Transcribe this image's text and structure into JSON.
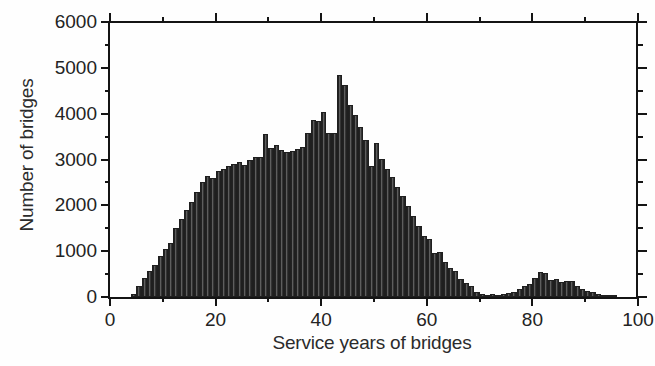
{
  "chart_data": {
    "type": "bar",
    "title": "",
    "subtitle": "",
    "xlabel": "Service years of bridges",
    "ylabel": "Number of bridges",
    "xlim": [
      0,
      100
    ],
    "ylim": [
      0,
      6000
    ],
    "grid": false,
    "legend": null,
    "bin_width": 1,
    "x_ticks": [
      0,
      20,
      40,
      60,
      80,
      100
    ],
    "x_tick_labels": [
      "0",
      "20",
      "40",
      "60",
      "80",
      "100"
    ],
    "x_minor_ticks": [
      10,
      30,
      50,
      70,
      90
    ],
    "y_ticks": [
      0,
      1000,
      2000,
      3000,
      4000,
      5000,
      6000
    ],
    "y_tick_labels": [
      "0",
      "1000",
      "2000",
      "3000",
      "4000",
      "5000",
      "6000"
    ],
    "y_minor_ticks": [
      500,
      1500,
      2500,
      3500,
      4500,
      5500
    ],
    "bar_color": "#4c4c4c",
    "bar_edge_color": "#1f1f1f",
    "axis_color": "#141414",
    "background_color": "#ffffff",
    "x": [
      4,
      5,
      6,
      7,
      8,
      9,
      10,
      11,
      12,
      13,
      14,
      15,
      16,
      17,
      18,
      19,
      20,
      21,
      22,
      23,
      24,
      25,
      26,
      27,
      28,
      29,
      30,
      31,
      32,
      33,
      34,
      35,
      36,
      37,
      38,
      39,
      40,
      41,
      42,
      43,
      44,
      45,
      46,
      47,
      48,
      49,
      50,
      51,
      52,
      53,
      54,
      55,
      56,
      57,
      58,
      59,
      60,
      61,
      62,
      63,
      64,
      65,
      66,
      67,
      68,
      69,
      70,
      71,
      72,
      73,
      74,
      75,
      76,
      77,
      78,
      79,
      80,
      81,
      82,
      83,
      84,
      85,
      86,
      87,
      88,
      89,
      90,
      91,
      92,
      93,
      94,
      95
    ],
    "values": [
      60,
      230,
      420,
      560,
      700,
      900,
      1040,
      1180,
      1500,
      1700,
      1900,
      2080,
      2300,
      2500,
      2640,
      2600,
      2740,
      2800,
      2850,
      2900,
      2950,
      2880,
      3000,
      3060,
      3060,
      3560,
      3250,
      3320,
      3200,
      3160,
      3180,
      3230,
      3280,
      3580,
      3860,
      3840,
      4030,
      3580,
      3580,
      4850,
      4620,
      4180,
      3980,
      3700,
      3420,
      2860,
      3360,
      3020,
      2800,
      2620,
      2400,
      2200,
      1980,
      1760,
      1540,
      1340,
      1260,
      960,
      980,
      760,
      640,
      560,
      400,
      300,
      230,
      120,
      70,
      50,
      75,
      40,
      55,
      90,
      110,
      180,
      230,
      290,
      420,
      540,
      520,
      380,
      390,
      330,
      360,
      340,
      250,
      180,
      130,
      100,
      70,
      45,
      30,
      15
    ]
  },
  "axes": {
    "x_title": "Service years of bridges",
    "y_title": "Number of bridges"
  }
}
